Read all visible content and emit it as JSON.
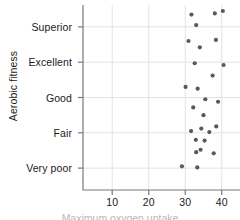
{
  "chart_data": {
    "type": "scatter",
    "title": "",
    "xlabel": "",
    "ylabel": "Aerobic fitness",
    "xlim": [
      2,
      45
    ],
    "ylim": [
      -0.62,
      4.62
    ],
    "grid": true,
    "legend": null,
    "x_ticks": [
      10,
      20,
      30,
      40
    ],
    "x_tick_labels": [
      "10",
      "20",
      "30",
      "40"
    ],
    "y_categories": [
      "Very poor",
      "Fair",
      "Good",
      "Excellent",
      "Superior"
    ],
    "y_tick_labels": [
      "Very poor",
      "Fair",
      "Good",
      "Excellent",
      "Superior"
    ],
    "point_color": "#595959",
    "point_radius": 2.1,
    "grid_color": "#e3e3e3",
    "axis_color": "#7a7a7a",
    "points": [
      {
        "x": 31.7,
        "y": 4.35
      },
      {
        "x": 38.1,
        "y": 4.38
      },
      {
        "x": 40.3,
        "y": 4.45
      },
      {
        "x": 33.0,
        "y": 4.05
      },
      {
        "x": 30.9,
        "y": 3.6
      },
      {
        "x": 38.4,
        "y": 3.63
      },
      {
        "x": 34.0,
        "y": 3.42
      },
      {
        "x": 32.6,
        "y": 2.97
      },
      {
        "x": 40.5,
        "y": 2.92
      },
      {
        "x": 37.5,
        "y": 2.62
      },
      {
        "x": 30.1,
        "y": 2.3
      },
      {
        "x": 33.4,
        "y": 2.25
      },
      {
        "x": 35.5,
        "y": 1.95
      },
      {
        "x": 39.0,
        "y": 1.88
      },
      {
        "x": 32.2,
        "y": 1.72
      },
      {
        "x": 35.0,
        "y": 1.5
      },
      {
        "x": 38.5,
        "y": 1.18
      },
      {
        "x": 34.4,
        "y": 1.12
      },
      {
        "x": 31.6,
        "y": 1.05
      },
      {
        "x": 36.6,
        "y": 1.02
      },
      {
        "x": 32.9,
        "y": 0.8
      },
      {
        "x": 35.3,
        "y": 0.78
      },
      {
        "x": 34.2,
        "y": 0.52
      },
      {
        "x": 33.0,
        "y": 0.45
      },
      {
        "x": 37.8,
        "y": 0.42
      },
      {
        "x": 29.1,
        "y": 0.05
      },
      {
        "x": 33.3,
        "y": 0.02
      }
    ]
  },
  "axes": {
    "x_title_clipped": "Maximum oxygen uptake"
  }
}
